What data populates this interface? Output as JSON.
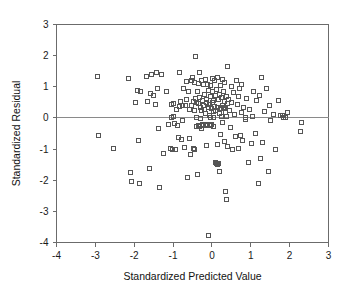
{
  "figure": {
    "background": "#ffffff",
    "marker_color": "#555555",
    "axis_color": "#6b6b6b",
    "zero_line_color": "#8a8a8a"
  },
  "chart_data": {
    "type": "scatter",
    "title": "",
    "xlabel": "Standardized Predicted Value",
    "ylabel": "Standardized Residual",
    "xlim": [
      -4,
      3
    ],
    "ylim": [
      -4,
      3
    ],
    "xticks": [
      -4,
      -3,
      -2,
      -1,
      0,
      1,
      2,
      3
    ],
    "xticklabels": [
      "-4",
      "-3",
      "-2",
      "-1",
      "0",
      "1",
      "2",
      "3"
    ],
    "yticks": [
      -4,
      -3,
      -2,
      -1,
      0,
      1,
      2,
      3
    ],
    "yticklabels": [
      "-4",
      "-3",
      "-2",
      "-1",
      "0",
      "1",
      "2",
      "3"
    ],
    "grid": false,
    "legend": null,
    "reference_lines": [
      {
        "orientation": "horizontal",
        "value": 0,
        "color": "#8a8a8a"
      }
    ],
    "marker": "open-square",
    "marker_size": 4,
    "n_points": 201,
    "points": [
      [
        -2.95,
        1.35
      ],
      [
        -2.92,
        -0.56
      ],
      [
        -2.55,
        -0.97
      ],
      [
        -2.17,
        1.28
      ],
      [
        -2.12,
        -1.75
      ],
      [
        -2.08,
        -2.02
      ],
      [
        -1.98,
        0.52
      ],
      [
        -1.93,
        0.9
      ],
      [
        -1.9,
        -0.72
      ],
      [
        -1.88,
        -2.08
      ],
      [
        -1.84,
        0.86
      ],
      [
        -1.7,
        1.34
      ],
      [
        -1.66,
        0.54
      ],
      [
        -1.62,
        -1.6
      ],
      [
        -1.6,
        0.8
      ],
      [
        -1.57,
        1.42
      ],
      [
        -1.52,
        0.75
      ],
      [
        -1.46,
        0.45
      ],
      [
        -1.44,
        1.46
      ],
      [
        -1.41,
        0.97
      ],
      [
        -1.38,
        -0.31
      ],
      [
        -1.35,
        -2.21
      ],
      [
        -1.3,
        1.41
      ],
      [
        -1.25,
        -1.14
      ],
      [
        -1.18,
        0.85
      ],
      [
        -1.12,
        -0.21
      ],
      [
        -1.08,
        -0.98
      ],
      [
        -1.05,
        0.46
      ],
      [
        -1.03,
        -1.01
      ],
      [
        -1.01,
        0.05
      ],
      [
        -1.0,
        0.07
      ],
      [
        -0.99,
        0.49
      ],
      [
        -0.97,
        -0.17
      ],
      [
        -0.95,
        -0.99
      ],
      [
        -0.93,
        0.28
      ],
      [
        -0.9,
        -0.23
      ],
      [
        -0.88,
        -0.62
      ],
      [
        -0.86,
        1.47
      ],
      [
        -0.84,
        0.38
      ],
      [
        -0.82,
        0.55
      ],
      [
        -0.8,
        -0.68
      ],
      [
        -0.78,
        -0.06
      ],
      [
        -0.76,
        0.41
      ],
      [
        -0.74,
        0.95
      ],
      [
        -0.72,
        -0.92
      ],
      [
        -0.7,
        0.43
      ],
      [
        -0.68,
        1.19
      ],
      [
        -0.66,
        0.6
      ],
      [
        -0.64,
        -1.9
      ],
      [
        -0.62,
        0.86
      ],
      [
        -0.6,
        -0.64
      ],
      [
        -0.58,
        0.29
      ],
      [
        -0.56,
        -1.17
      ],
      [
        -0.54,
        1.23
      ],
      [
        -0.52,
        1.3
      ],
      [
        -0.5,
        -0.98
      ],
      [
        -0.48,
        0.55
      ],
      [
        -0.47,
        1.16
      ],
      [
        -0.46,
        -1.0
      ],
      [
        -0.45,
        0.27
      ],
      [
        -0.44,
        0.63
      ],
      [
        -0.43,
        1.98
      ],
      [
        -0.42,
        -0.27
      ],
      [
        -0.41,
        0.04
      ],
      [
        -0.4,
        0.52
      ],
      [
        -0.39,
        -1.8
      ],
      [
        -0.38,
        0.88
      ],
      [
        -0.37,
        -0.22
      ],
      [
        -0.36,
        1.13
      ],
      [
        -0.35,
        0.48
      ],
      [
        -0.34,
        0.66
      ],
      [
        -0.33,
        -0.26
      ],
      [
        -0.32,
        1.47
      ],
      [
        -0.31,
        0.35
      ],
      [
        -0.3,
        -0.01
      ],
      [
        -0.29,
        1.22
      ],
      [
        -0.28,
        0.24
      ],
      [
        -0.27,
        -0.31
      ],
      [
        -0.26,
        0.57
      ],
      [
        -0.25,
        -0.21
      ],
      [
        -0.24,
        1.08
      ],
      [
        -0.23,
        0.42
      ],
      [
        -0.22,
        -0.24
      ],
      [
        -0.21,
        0.3
      ],
      [
        -0.2,
        0.77
      ],
      [
        -0.19,
        -0.19
      ],
      [
        -0.18,
        1.25
      ],
      [
        -0.17,
        0.15
      ],
      [
        -0.16,
        0.5
      ],
      [
        -0.15,
        -0.88
      ],
      [
        -0.14,
        0.62
      ],
      [
        -0.13,
        1.1
      ],
      [
        -0.12,
        -0.2
      ],
      [
        -0.11,
        0.36
      ],
      [
        -0.1,
        -3.75
      ],
      [
        -0.09,
        0.9
      ],
      [
        -0.08,
        0.11
      ],
      [
        -0.07,
        0.44
      ],
      [
        -0.06,
        -0.23
      ],
      [
        -0.05,
        1.07
      ],
      [
        -0.04,
        0.69
      ],
      [
        -0.03,
        0.33
      ],
      [
        -0.02,
        -0.18
      ],
      [
        -0.01,
        0.52
      ],
      [
        0.0,
        0.86
      ],
      [
        0.01,
        1.28
      ],
      [
        0.02,
        0.21
      ],
      [
        0.03,
        -0.25
      ],
      [
        0.04,
        0.58
      ],
      [
        0.05,
        0.39
      ],
      [
        0.06,
        1.22
      ],
      [
        0.07,
        -1.42
      ],
      [
        0.08,
        0.73
      ],
      [
        0.09,
        0.26
      ],
      [
        0.1,
        -1.45
      ],
      [
        0.11,
        0.92
      ],
      [
        0.12,
        -0.84
      ],
      [
        0.13,
        0.36
      ],
      [
        0.14,
        1.31
      ],
      [
        0.15,
        -1.44
      ],
      [
        0.16,
        0.61
      ],
      [
        0.17,
        0.15
      ],
      [
        0.18,
        -1.71
      ],
      [
        0.19,
        0.78
      ],
      [
        0.2,
        1.05
      ],
      [
        0.21,
        0.31
      ],
      [
        0.22,
        -0.52
      ],
      [
        0.23,
        0.66
      ],
      [
        0.24,
        0.07
      ],
      [
        0.25,
        1.26
      ],
      [
        0.26,
        0.41
      ],
      [
        0.27,
        -0.12
      ],
      [
        0.28,
        0.88
      ],
      [
        0.29,
        0.34
      ],
      [
        0.3,
        -0.75
      ],
      [
        0.31,
        0.53
      ],
      [
        0.32,
        1.16
      ],
      [
        0.33,
        0.19
      ],
      [
        0.34,
        -2.34
      ],
      [
        0.35,
        0.72
      ],
      [
        0.36,
        0.05
      ],
      [
        0.37,
        -2.6
      ],
      [
        0.38,
        0.47
      ],
      [
        0.39,
        1.67
      ],
      [
        0.4,
        -0.9
      ],
      [
        0.42,
        0.6
      ],
      [
        0.44,
        0.25
      ],
      [
        0.46,
        -0.3
      ],
      [
        0.48,
        1.02
      ],
      [
        0.5,
        0.51
      ],
      [
        0.52,
        -1.0
      ],
      [
        0.55,
        0.83
      ],
      [
        0.58,
        0.12
      ],
      [
        0.6,
        -0.57
      ],
      [
        0.62,
        1.21
      ],
      [
        0.64,
        0.44
      ],
      [
        0.66,
        -0.97
      ],
      [
        0.68,
        0.7
      ],
      [
        0.7,
        0.96
      ],
      [
        0.72,
        -0.55
      ],
      [
        0.74,
        0.18
      ],
      [
        0.76,
        1.08
      ],
      [
        0.78,
        -0.7
      ],
      [
        0.8,
        0.35
      ],
      [
        0.84,
        -0.04
      ],
      [
        0.88,
        0.64
      ],
      [
        0.92,
        -1.4
      ],
      [
        0.96,
        0.29
      ],
      [
        1.0,
        -0.79
      ],
      [
        1.02,
        0.05
      ],
      [
        1.06,
        0.88
      ],
      [
        1.1,
        -0.48
      ],
      [
        1.14,
        0.56
      ],
      [
        1.18,
        -2.1
      ],
      [
        1.22,
        0.73
      ],
      [
        1.24,
        -1.29
      ],
      [
        1.26,
        1.31
      ],
      [
        1.3,
        -0.77
      ],
      [
        1.34,
        0.22
      ],
      [
        1.4,
        0.97
      ],
      [
        1.44,
        -1.7
      ],
      [
        1.48,
        0.41
      ],
      [
        1.5,
        -0.08
      ],
      [
        1.56,
        0.12
      ],
      [
        1.62,
        -0.99
      ],
      [
        1.7,
        0.56
      ],
      [
        1.74,
        0.08
      ],
      [
        1.8,
        0.1
      ],
      [
        1.84,
        0.02
      ],
      [
        1.88,
        0.03
      ],
      [
        1.92,
        0.2
      ],
      [
        2.26,
        -0.42
      ],
      [
        2.3,
        -0.13
      ],
      [
        -1.06,
        0.03
      ],
      [
        -0.55,
        0.42
      ],
      [
        -0.06,
        0.03
      ],
      [
        0.04,
        0.04
      ],
      [
        0.3,
        0.36
      ],
      [
        0.33,
        0.33
      ],
      [
        -0.14,
        -0.23
      ],
      [
        -0.18,
        -0.22
      ],
      [
        0.12,
        -1.47
      ],
      [
        0.86,
        0.02
      ]
    ]
  }
}
